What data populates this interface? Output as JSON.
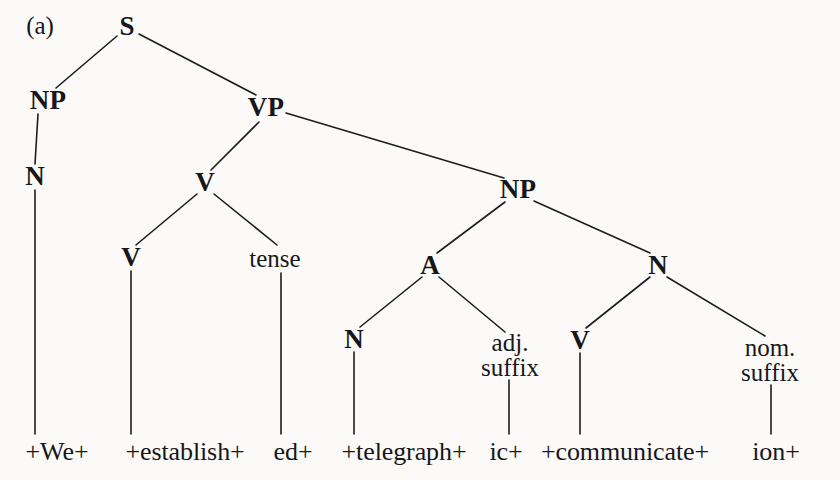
{
  "figure": {
    "label": "(a)",
    "label_pos": {
      "x": 40,
      "y": 26
    },
    "width": 840,
    "height": 480,
    "background_color": "#fbfaf8",
    "ink_color": "#17171a"
  },
  "tree": {
    "nodes": [
      {
        "id": "S",
        "label": "S",
        "kind": "category",
        "x": 127,
        "y": 26,
        "lines": 1
      },
      {
        "id": "NP1",
        "label": "NP",
        "kind": "category",
        "x": 48,
        "y": 100,
        "lines": 1
      },
      {
        "id": "VP",
        "label": "VP",
        "kind": "category",
        "x": 266,
        "y": 107,
        "lines": 1
      },
      {
        "id": "N1",
        "label": "N",
        "kind": "category",
        "x": 35,
        "y": 176,
        "lines": 1
      },
      {
        "id": "V1",
        "label": "V",
        "kind": "category",
        "x": 205,
        "y": 182,
        "lines": 1
      },
      {
        "id": "NP2",
        "label": "NP",
        "kind": "category",
        "x": 518,
        "y": 189,
        "lines": 1
      },
      {
        "id": "V2",
        "label": "V",
        "kind": "category",
        "x": 131,
        "y": 257,
        "lines": 1
      },
      {
        "id": "TENSE",
        "label": "tense",
        "kind": "lexical",
        "x": 275,
        "y": 259,
        "lines": 1
      },
      {
        "id": "A",
        "label": "A",
        "kind": "category",
        "x": 430,
        "y": 265,
        "lines": 1
      },
      {
        "id": "N2",
        "label": "N",
        "kind": "category",
        "x": 658,
        "y": 265,
        "lines": 1
      },
      {
        "id": "N3",
        "label": "N",
        "kind": "category",
        "x": 354,
        "y": 339,
        "lines": 1
      },
      {
        "id": "ADJSUF",
        "label": "adj.\nsuffix",
        "kind": "lexical",
        "x": 510,
        "y": 355,
        "lines": 2
      },
      {
        "id": "V3",
        "label": "V",
        "kind": "category",
        "x": 580,
        "y": 340,
        "lines": 1
      },
      {
        "id": "NOMSUF",
        "label": "nom.\nsuffix",
        "kind": "lexical",
        "x": 770,
        "y": 360,
        "lines": 2
      }
    ],
    "edges": [
      {
        "from": "S",
        "to": "NP1",
        "x1": 117,
        "y1": 36,
        "x2": 56,
        "y2": 88
      },
      {
        "from": "S",
        "to": "VP",
        "x1": 139,
        "y1": 34,
        "x2": 256,
        "y2": 95
      },
      {
        "from": "NP1",
        "to": "N1",
        "x1": 38,
        "y1": 114,
        "x2": 35,
        "y2": 164
      },
      {
        "from": "VP",
        "to": "V1",
        "x1": 259,
        "y1": 122,
        "x2": 211,
        "y2": 170
      },
      {
        "from": "VP",
        "to": "NP2",
        "x1": 286,
        "y1": 113,
        "x2": 504,
        "y2": 178
      },
      {
        "from": "N1",
        "to": "leaf1",
        "x1": 35,
        "y1": 190,
        "x2": 35,
        "y2": 434
      },
      {
        "from": "V1",
        "to": "V2",
        "x1": 197,
        "y1": 194,
        "x2": 136,
        "y2": 245
      },
      {
        "from": "V1",
        "to": "TENSE",
        "x1": 214,
        "y1": 194,
        "x2": 277,
        "y2": 245
      },
      {
        "from": "NP2",
        "to": "A",
        "x1": 505,
        "y1": 202,
        "x2": 437,
        "y2": 253
      },
      {
        "from": "NP2",
        "to": "N2",
        "x1": 534,
        "y1": 201,
        "x2": 650,
        "y2": 253
      },
      {
        "from": "V2",
        "to": "leaf2",
        "x1": 131,
        "y1": 271,
        "x2": 131,
        "y2": 434
      },
      {
        "from": "TENSE",
        "to": "leaf3",
        "x1": 281,
        "y1": 273,
        "x2": 281,
        "y2": 434
      },
      {
        "from": "A",
        "to": "N3",
        "x1": 422,
        "y1": 277,
        "x2": 360,
        "y2": 327
      },
      {
        "from": "A",
        "to": "ADJSUF",
        "x1": 439,
        "y1": 277,
        "x2": 505,
        "y2": 332
      },
      {
        "from": "N2",
        "to": "V3",
        "x1": 650,
        "y1": 277,
        "x2": 586,
        "y2": 328
      },
      {
        "from": "N2",
        "to": "NOMSUF",
        "x1": 667,
        "y1": 277,
        "x2": 765,
        "y2": 336
      },
      {
        "from": "N3",
        "to": "leaf4",
        "x1": 354,
        "y1": 352,
        "x2": 354,
        "y2": 434
      },
      {
        "from": "ADJSUF",
        "to": "leaf5",
        "x1": 509,
        "y1": 380,
        "x2": 509,
        "y2": 434
      },
      {
        "from": "V3",
        "to": "leaf6",
        "x1": 580,
        "y1": 353,
        "x2": 580,
        "y2": 434
      },
      {
        "from": "NOMSUF",
        "to": "leaf7",
        "x1": 771,
        "y1": 385,
        "x2": 771,
        "y2": 434
      }
    ],
    "leaves": [
      {
        "id": "leaf1",
        "text": "+We+",
        "x": 57,
        "y": 452
      },
      {
        "id": "leaf2",
        "text": "+establish+",
        "x": 185,
        "y": 452
      },
      {
        "id": "leaf3",
        "text": "ed+",
        "x": 293,
        "y": 452
      },
      {
        "id": "leaf4",
        "text": "+telegraph+",
        "x": 404,
        "y": 452
      },
      {
        "id": "leaf5",
        "text": "ic+",
        "x": 506,
        "y": 452
      },
      {
        "id": "leaf6",
        "text": "+communicate+",
        "x": 625,
        "y": 452
      },
      {
        "id": "leaf7",
        "text": "ion+",
        "x": 776,
        "y": 452
      }
    ],
    "sentence": "+We+ +establish+ed+ +telegraph+ic+ +communicate+ion+",
    "line_color": "#1d1d20",
    "line_width": 1.6
  }
}
